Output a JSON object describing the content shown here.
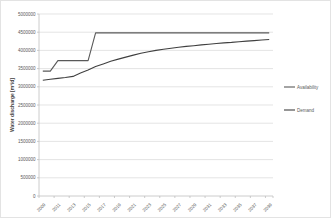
{
  "chart_data": {
    "type": "line",
    "title": "",
    "xlabel": "",
    "ylabel": "Water discharge [m³/d]",
    "ylim": [
      0,
      5000000
    ],
    "ytick_step": 500000,
    "grid": true,
    "legend_position": "right",
    "x": [
      2009,
      2010,
      2011,
      2012,
      2013,
      2014,
      2015,
      2016,
      2017,
      2018,
      2019,
      2020,
      2021,
      2022,
      2023,
      2024,
      2025,
      2026,
      2027,
      2028,
      2029,
      2030,
      2031,
      2032,
      2033,
      2034,
      2035,
      2036,
      2037,
      2038,
      2039
    ],
    "xtick_labels": [
      "2009",
      "2011",
      "2013",
      "2015",
      "2017",
      "2019",
      "2021",
      "2023",
      "2025",
      "2027",
      "2029",
      "2031",
      "2033",
      "2035",
      "2037",
      "2039"
    ],
    "xtick_interval": 2,
    "ytick_labels": [
      "0",
      "500000",
      "1000000",
      "1500000",
      "2000000",
      "2500000",
      "3000000",
      "3500000",
      "4000000",
      "4500000",
      "5000000"
    ],
    "series": [
      {
        "name": "Availability",
        "color": "#595959",
        "values": [
          3430000,
          3430000,
          3720000,
          3720000,
          3720000,
          3720000,
          3720000,
          4480000,
          4480000,
          4480000,
          4480000,
          4480000,
          4480000,
          4480000,
          4480000,
          4480000,
          4480000,
          4480000,
          4480000,
          4480000,
          4480000,
          4480000,
          4480000,
          4480000,
          4480000,
          4480000,
          4480000,
          4480000,
          4480000,
          4480000,
          4480000
        ]
      },
      {
        "name": "Demand",
        "color": "#404040",
        "values": [
          3180000,
          3205000,
          3230000,
          3255000,
          3285000,
          3380000,
          3460000,
          3555000,
          3630000,
          3700000,
          3760000,
          3815000,
          3870000,
          3920000,
          3965000,
          4000000,
          4030000,
          4060000,
          4085000,
          4110000,
          4130000,
          4150000,
          4170000,
          4190000,
          4205000,
          4220000,
          4240000,
          4255000,
          4270000,
          4285000,
          4300000
        ]
      }
    ]
  },
  "style": {
    "background": "#ffffff",
    "gridline_color": "#d9d9d9",
    "axis_color": "#bfbfbf",
    "tick_text_color": "#595959",
    "axis_title_color": "#3f3f3f",
    "legend_text_color": "#595959"
  }
}
